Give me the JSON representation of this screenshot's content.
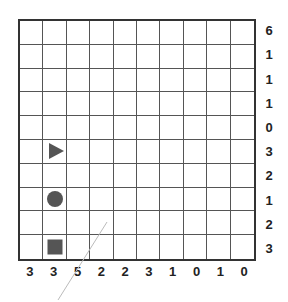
{
  "puzzle": {
    "rows": 10,
    "cols": 10,
    "row_clues": [
      "6",
      "1",
      "1",
      "1",
      "0",
      "3",
      "2",
      "1",
      "2",
      "3"
    ],
    "col_clues": [
      "3",
      "3",
      "5",
      "2",
      "2",
      "3",
      "1",
      "0",
      "1",
      "0"
    ],
    "pieces": [
      {
        "type": "triangle",
        "row": 5,
        "col": 1
      },
      {
        "type": "circle",
        "row": 7,
        "col": 1
      },
      {
        "type": "square",
        "row": 9,
        "col": 1
      }
    ]
  },
  "colors": {
    "grid_line": "#555555",
    "border": "#333333",
    "piece": "#555555",
    "clue_text": "#222222",
    "stray_line": "#bbbbbb"
  }
}
